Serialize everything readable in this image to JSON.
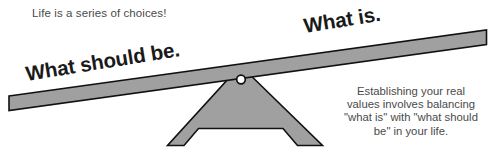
{
  "illustration": {
    "title": "Life is a series of choices!",
    "type": "seesaw-balance-diagram",
    "caption": "Life is a series of choices!",
    "beam_labels": {
      "left": "What should be.",
      "right": "What is."
    },
    "explainer": {
      "lines": [
        "Establishing your real",
        "values involves balancing",
        "\"what is\" with \"what should",
        "be\" in your life."
      ],
      "full_text": "Establishing your real values involves balancing \"what is\" with \"what should be\" in your life."
    },
    "colors": {
      "background": "#ffffff",
      "shape_fill": "#a0a0a0",
      "shape_stroke": "#111111",
      "label_text": "#1a1a1a",
      "body_text": "#4a4a4a"
    },
    "parts": {
      "beam": "lever-beam",
      "fulcrum": "fulcrum-triangle",
      "pivot": "pivot-hole"
    }
  }
}
